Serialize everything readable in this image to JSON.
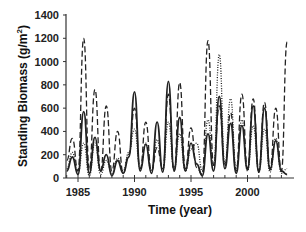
{
  "chart_data": {
    "type": "line",
    "title": "",
    "xlabel": "Time (year)",
    "ylabel": "Standing Biomass (g/m2)",
    "ylabel_main": "Standing Biomass (g/m",
    "ylabel_sup": "2",
    "ylabel_close": ")",
    "xlim": [
      1984,
      2003.9
    ],
    "ylim": [
      0,
      1400
    ],
    "x_ticks": [
      1985,
      1990,
      1995,
      2000
    ],
    "x_tick_labels": [
      "1985",
      "1990",
      "1995",
      "2000"
    ],
    "y_ticks": [
      0,
      200,
      400,
      600,
      800,
      1000,
      1200,
      1400
    ],
    "y_tick_labels": [
      "0",
      "200",
      "400",
      "600",
      "800",
      "1000",
      "1200",
      "1400"
    ],
    "grid": false,
    "legend": "none",
    "x": [
      1984.0,
      1984.5,
      1985.0,
      1985.5,
      1986.0,
      1986.5,
      1987.0,
      1987.5,
      1988.0,
      1988.5,
      1989.0,
      1989.5,
      1990.0,
      1990.5,
      1991.0,
      1991.5,
      1992.0,
      1992.5,
      1993.0,
      1993.5,
      1994.0,
      1994.5,
      1995.0,
      1995.5,
      1996.0,
      1996.5,
      1997.0,
      1997.5,
      1998.0,
      1998.5,
      1999.0,
      1999.5,
      2000.0,
      2000.5,
      2001.0,
      2001.5,
      2002.0,
      2002.5,
      2003.0,
      2003.5
    ],
    "series": [
      {
        "name": "solid",
        "style": "solid",
        "values": [
          60,
          180,
          30,
          570,
          40,
          350,
          60,
          200,
          20,
          150,
          40,
          180,
          740,
          60,
          290,
          40,
          480,
          50,
          830,
          60,
          520,
          60,
          300,
          120,
          20,
          380,
          60,
          700,
          80,
          470,
          40,
          450,
          70,
          620,
          50,
          600,
          70,
          320,
          60,
          30
        ]
      },
      {
        "name": "dashed",
        "style": "dashed",
        "values": [
          150,
          340,
          60,
          1200,
          70,
          760,
          50,
          620,
          60,
          400,
          40,
          200,
          600,
          80,
          480,
          60,
          260,
          80,
          720,
          60,
          820,
          80,
          430,
          90,
          30,
          1180,
          110,
          620,
          100,
          560,
          60,
          720,
          80,
          680,
          60,
          650,
          80,
          600,
          60,
          1170
        ]
      },
      {
        "name": "dotted",
        "style": "dotted",
        "values": [
          80,
          220,
          40,
          300,
          20,
          300,
          30,
          150,
          40,
          170,
          60,
          220,
          420,
          80,
          300,
          60,
          330,
          70,
          480,
          80,
          380,
          60,
          250,
          300,
          60,
          500,
          100,
          1060,
          120,
          680,
          80,
          500,
          60,
          450,
          60,
          420,
          50,
          340,
          40,
          80
        ]
      }
    ]
  }
}
